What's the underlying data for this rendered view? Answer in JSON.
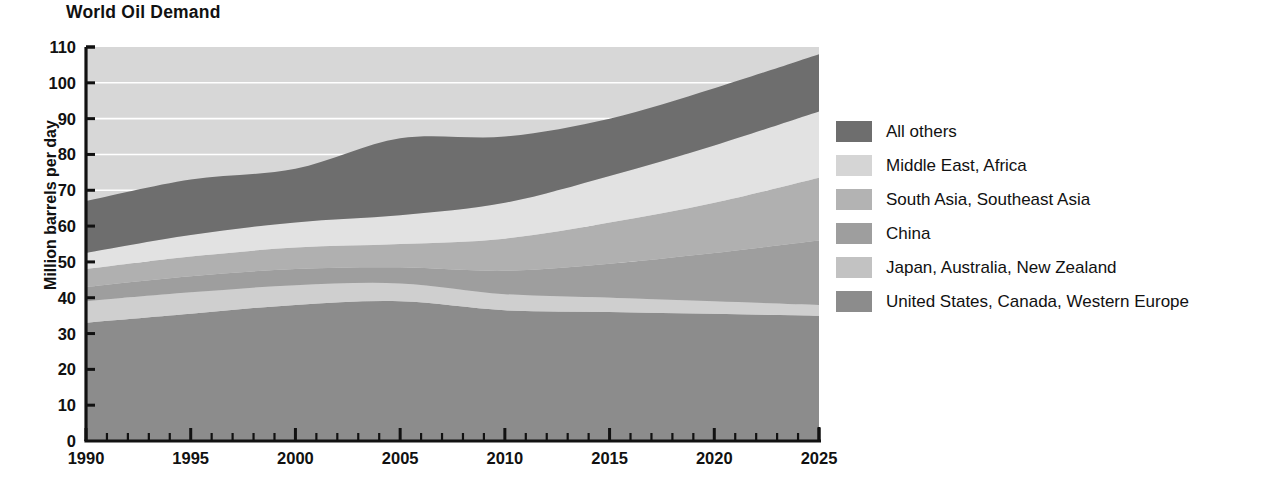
{
  "chart_data": {
    "type": "area",
    "title": "World Oil Demand",
    "xlabel": "",
    "ylabel": "Million barrels per day",
    "xlim": [
      1990,
      2025
    ],
    "ylim": [
      0,
      110
    ],
    "ytick_labels": [
      "110",
      "100",
      "90",
      "80",
      "70",
      "60",
      "50",
      "40",
      "30",
      "20",
      "10",
      "0"
    ],
    "ytick_values": [
      110,
      100,
      90,
      80,
      70,
      60,
      50,
      40,
      30,
      20,
      10,
      0
    ],
    "xtick_labels": [
      "1990",
      "1995",
      "2000",
      "2005",
      "2010",
      "2015",
      "2020",
      "2025"
    ],
    "xtick_values": [
      1990,
      1995,
      2000,
      2005,
      2010,
      2015,
      2020,
      2025
    ],
    "minor_xtick_interval": 1,
    "grid": "horizontal-white-gridlines",
    "stacked": true,
    "legend_position": "right",
    "x": [
      1990,
      1995,
      2000,
      2005,
      2010,
      2015,
      2020,
      2025
    ],
    "series": [
      {
        "name": "United States, Canada, Western Europe",
        "color": "#8c8c8c",
        "values": [
          33.0,
          35.5,
          38.0,
          39.0,
          36.5,
          36.0,
          35.5,
          35.0
        ]
      },
      {
        "name": "Japan, Australia, New Zealand",
        "color": "#cfcfcf",
        "values": [
          6.0,
          6.0,
          5.5,
          5.0,
          4.5,
          4.0,
          3.5,
          3.0
        ]
      },
      {
        "name": "China",
        "color": "#9e9e9e",
        "values": [
          4.0,
          4.5,
          4.5,
          4.5,
          6.5,
          9.5,
          13.5,
          18.0
        ]
      },
      {
        "name": "South Asia, Southeast Asia",
        "color": "#b0b0b0",
        "values": [
          5.0,
          5.5,
          6.0,
          6.5,
          9.0,
          11.5,
          14.0,
          17.5
        ]
      },
      {
        "name": "Middle East, Africa",
        "color": "#e2e2e2",
        "values": [
          4.5,
          6.0,
          7.0,
          8.0,
          10.0,
          13.0,
          16.0,
          18.5
        ]
      },
      {
        "name": "All others",
        "color": "#6e6e6e",
        "values": [
          14.5,
          15.5,
          15.0,
          21.5,
          18.5,
          16.0,
          16.0,
          16.0
        ]
      }
    ],
    "totals": [
      67.0,
      73.0,
      76.0,
      84.5,
      85.0,
      90.0,
      98.5,
      108.0
    ],
    "plot_background": "#d7d7d7"
  },
  "legend": {
    "items": [
      {
        "label": "All others",
        "color": "#6e6e6e"
      },
      {
        "label": "Middle East, Africa",
        "color": "#d5d5d5"
      },
      {
        "label": "South Asia, Southeast Asia",
        "color": "#b3b3b3"
      },
      {
        "label": "China",
        "color": "#9e9e9e"
      },
      {
        "label": "Japan, Australia, New Zealand",
        "color": "#c2c2c2"
      },
      {
        "label": "United States, Canada, Western Europe",
        "color": "#8c8c8c"
      }
    ]
  }
}
